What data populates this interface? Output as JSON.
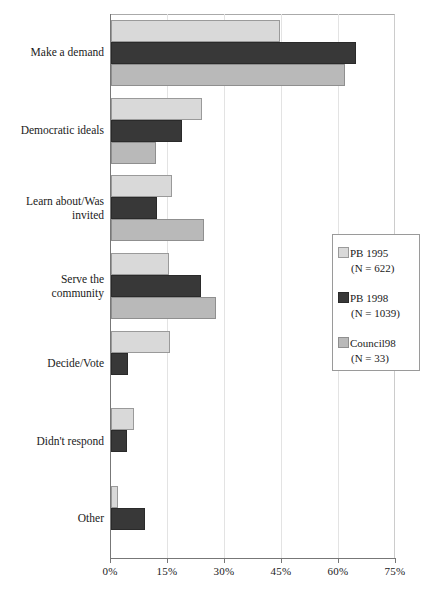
{
  "chart_data": {
    "type": "bar",
    "orientation": "horizontal",
    "title": "",
    "subtitle": "",
    "xlabel": "",
    "ylabel": "",
    "xlim": [
      0,
      75
    ],
    "xtick_labels": [
      "0%",
      "15%",
      "30%",
      "45%",
      "60%",
      "75%"
    ],
    "xticks": [
      0,
      15,
      30,
      45,
      60,
      75
    ],
    "grid": true,
    "grid_axis": "x",
    "legend_position": "right-middle",
    "categories": [
      "Make a demand",
      "Democratic ideals",
      "Learn about/Was invited",
      "Serve the community",
      "Decide/Vote",
      "Didn't respond",
      "Other"
    ],
    "series": [
      {
        "name": "PB 1995",
        "n_label": "(N = 622)",
        "color": "#d9d9d9",
        "values": [
          44.5,
          24.0,
          16.0,
          15.3,
          15.5,
          6.0,
          1.8
        ]
      },
      {
        "name": "PB 1998",
        "n_label": "(N = 1039)",
        "color": "#383838",
        "values": [
          64.5,
          18.7,
          12.0,
          23.7,
          4.5,
          4.2,
          9.0
        ]
      },
      {
        "name": "Council98",
        "n_label": "(N = 33)",
        "color": "#b9b9b9",
        "values": [
          61.5,
          11.8,
          24.5,
          27.6,
          0,
          0,
          0
        ]
      }
    ]
  },
  "legend": {
    "entries": [
      {
        "label": "PB 1995",
        "n": "(N = 622)"
      },
      {
        "label": "PB 1998",
        "n": "(N = 1039)"
      },
      {
        "label": "Council98",
        "n": "(N = 33)"
      }
    ]
  },
  "axis": {
    "x_tick_labels": [
      "0%",
      "15%",
      "30%",
      "45%",
      "60%",
      "75%"
    ]
  },
  "categories": [
    {
      "line1": "Make a demand",
      "line2": ""
    },
    {
      "line1": "Democratic ideals",
      "line2": ""
    },
    {
      "line1": "Learn about/Was",
      "line2": "invited"
    },
    {
      "line1": "Serve the",
      "line2": "community"
    },
    {
      "line1": "Decide/Vote",
      "line2": ""
    },
    {
      "line1": "Didn't respond",
      "line2": ""
    },
    {
      "line1": "Other",
      "line2": ""
    }
  ]
}
